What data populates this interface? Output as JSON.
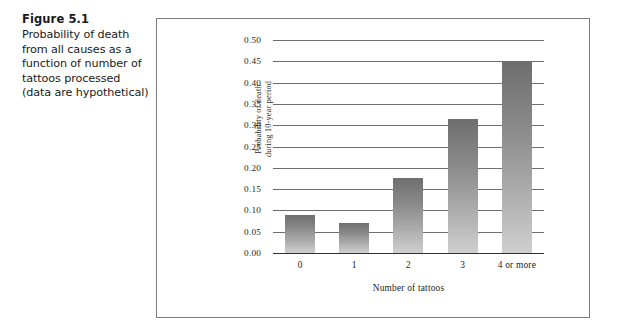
{
  "figure": {
    "number": "Figure 5.1",
    "caption": "Probability of death from all causes as a function of number of tattoos processed (data are hypothetical)"
  },
  "chart_data": {
    "type": "bar",
    "title": "",
    "categories": [
      "0",
      "1",
      "2",
      "3",
      "4 or more"
    ],
    "values": [
      0.09,
      0.07,
      0.175,
      0.315,
      0.45
    ],
    "xlabel": "Number of tattoos",
    "ylabel": "Probability of death during 10-year period",
    "ylabel_line1": "Probability of death",
    "ylabel_line2": "during 10-year period",
    "ylim": [
      0.0,
      0.5
    ],
    "ytick_step": 0.05,
    "yticks": [
      "0.50",
      "0.45",
      "0.40",
      "0.35",
      "0.30",
      "0.25",
      "0.20",
      "0.15",
      "0.10",
      "0.05",
      "0.00"
    ],
    "grid": true,
    "legend": "none",
    "colors": {
      "bar_top": "#6e6e6e",
      "bar_bottom": "#cfcfcf",
      "gridline": "#6e6e6e",
      "axis": "#2f2f2f",
      "frame": "#7b7b7b",
      "text": "#1d1d1d"
    }
  }
}
